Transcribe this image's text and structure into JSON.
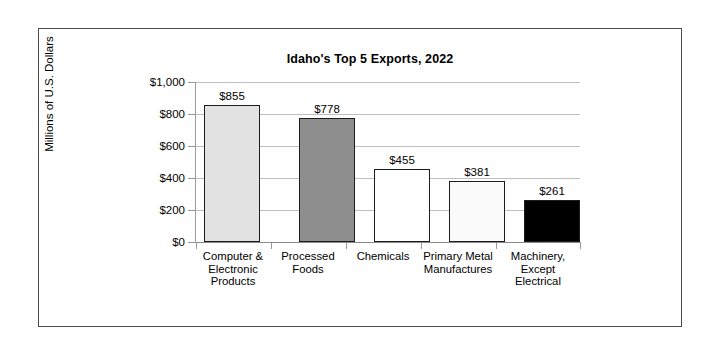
{
  "chart_data": {
    "type": "bar",
    "title": "Idaho's Top 5 Exports, 2022",
    "xlabel": "",
    "ylabel": "Millions of U.S. Dollars",
    "ylim": [
      0,
      1000
    ],
    "ytick_values": [
      0,
      200,
      400,
      600,
      800,
      1000
    ],
    "ytick_labels": [
      "$0",
      "$200",
      "$400",
      "$600",
      "$800",
      "$1,000"
    ],
    "grid": true,
    "legend": "none",
    "categories": [
      "Computer & Electronic Products",
      "Processed Foods",
      "Chemicals",
      "Primary Metal Manufactures",
      "Machinery, Except Electrical"
    ],
    "category_label_lines": [
      "Computer &\nElectronic\nProducts",
      "Processed\nFoods",
      "Chemicals",
      "Primary Metal\nManufactures",
      "Machinery,\nExcept\nElectrical"
    ],
    "values": [
      855,
      778,
      455,
      381,
      261
    ],
    "value_labels": [
      "$855",
      "$778",
      "$455",
      "$381",
      "$261"
    ],
    "bar_colors": [
      "#e2e2e2",
      "#8e8e8e",
      "#ffffff",
      "#fafafa",
      "#000000"
    ],
    "bar_edge_color": "#1c1c1c",
    "gridline_color": "#bfbfbf",
    "frame_color": "#4a4a4a",
    "background": "#ffffff"
  }
}
